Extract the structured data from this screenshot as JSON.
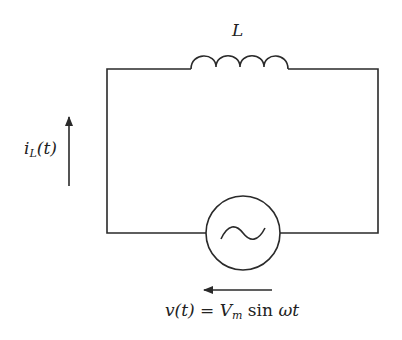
{
  "diagram": {
    "type": "circuit",
    "components": [
      {
        "id": "inductor",
        "label": "L"
      },
      {
        "id": "ac-source",
        "label": "v(t) = V_m sin ωt"
      }
    ],
    "labels": {
      "inductor": "L",
      "current_main": "i",
      "current_sub": "L",
      "current_arg": "(t)",
      "voltage_lhs": "v(t) = V",
      "voltage_sub": "m",
      "voltage_rhs_fn": " sin ",
      "voltage_rhs_var": "ωt"
    },
    "colors": {
      "stroke": "#2a2a2a",
      "background": "#ffffff"
    }
  }
}
